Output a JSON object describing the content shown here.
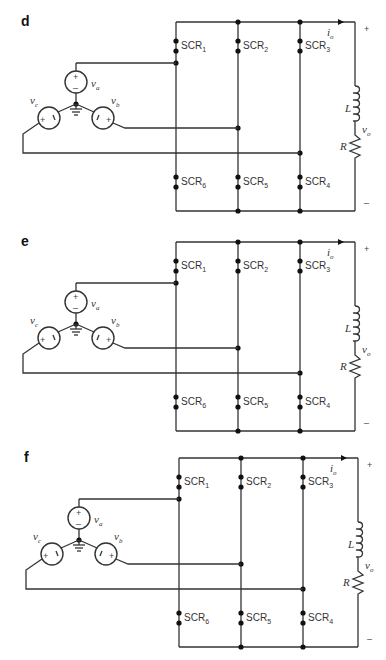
{
  "figure": {
    "panels": [
      {
        "id": "d",
        "label": "d",
        "sources": {
          "va": "v",
          "va_sub": "a",
          "vb": "v",
          "vb_sub": "b",
          "vc": "v",
          "vc_sub": "c",
          "plus": "+",
          "minus": "–"
        },
        "scr": [
          {
            "name": "SCR",
            "sub": "1"
          },
          {
            "name": "SCR",
            "sub": "2"
          },
          {
            "name": "SCR",
            "sub": "3"
          },
          {
            "name": "SCR",
            "sub": "6"
          },
          {
            "name": "SCR",
            "sub": "5"
          },
          {
            "name": "SCR",
            "sub": "4"
          }
        ],
        "load": {
          "inductor": "L",
          "resistor": "R",
          "vo": "v",
          "vo_sub": "o",
          "io": "i",
          "io_sub": "o",
          "plus": "+",
          "minus": "–"
        }
      },
      {
        "id": "e",
        "label": "e",
        "sources": {
          "va": "v",
          "va_sub": "a",
          "vb": "v",
          "vb_sub": "b",
          "vc": "v",
          "vc_sub": "c",
          "plus": "+",
          "minus": "–"
        },
        "scr": [
          {
            "name": "SCR",
            "sub": "1"
          },
          {
            "name": "SCR",
            "sub": "2"
          },
          {
            "name": "SCR",
            "sub": "3"
          },
          {
            "name": "SCR",
            "sub": "6"
          },
          {
            "name": "SCR",
            "sub": "5"
          },
          {
            "name": "SCR",
            "sub": "4"
          }
        ],
        "load": {
          "inductor": "L",
          "resistor": "R",
          "vo": "v",
          "vo_sub": "o",
          "io": "i",
          "io_sub": "o",
          "plus": "+",
          "minus": "–"
        }
      },
      {
        "id": "f",
        "label": "f",
        "sources": {
          "va": "v",
          "va_sub": "a",
          "vb": "v",
          "vb_sub": "b",
          "vc": "v",
          "vc_sub": "c",
          "plus": "+",
          "minus": "–"
        },
        "scr": [
          {
            "name": "SCR",
            "sub": "1"
          },
          {
            "name": "SCR",
            "sub": "2"
          },
          {
            "name": "SCR",
            "sub": "3"
          },
          {
            "name": "SCR",
            "sub": "6"
          },
          {
            "name": "SCR",
            "sub": "5"
          },
          {
            "name": "SCR",
            "sub": "4"
          }
        ],
        "load": {
          "inductor": "L",
          "resistor": "R",
          "vo": "v",
          "vo_sub": "o",
          "io": "i",
          "io_sub": "o",
          "plus": "+",
          "minus": "–"
        }
      }
    ]
  }
}
